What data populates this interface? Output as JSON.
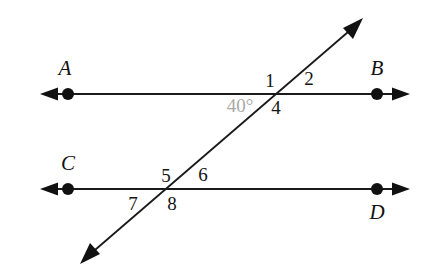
{
  "figure": {
    "kind": "geometry-diagram",
    "width": 433,
    "height": 279,
    "background_color": "#ffffff",
    "stroke_color": "#1a1a1a",
    "measure_color": "#a9a9a9"
  },
  "lines": [
    {
      "id": "line-ab",
      "name": "AB",
      "orientation": "horizontal",
      "y": 94,
      "x_start": 40,
      "x_end": 410,
      "arrow_start": true,
      "arrow_end": true,
      "endpoint_dots": [
        68,
        377
      ]
    },
    {
      "id": "line-cd",
      "name": "CD",
      "orientation": "horizontal",
      "y": 189,
      "x_start": 40,
      "x_end": 410,
      "arrow_start": true,
      "arrow_end": true,
      "endpoint_dots": [
        68,
        377
      ]
    },
    {
      "id": "line-transversal",
      "name": "transversal",
      "orientation": "diagonal",
      "x_start": 80,
      "y_start": 264,
      "x_end": 363,
      "y_end": 18,
      "arrow_start": true,
      "arrow_end": true,
      "endpoint_dots": []
    }
  ],
  "intersections": [
    {
      "id": "upper",
      "x": 278,
      "y": 94,
      "on_line": "AB"
    },
    {
      "id": "lower",
      "x": 169,
      "y": 189,
      "on_line": "CD"
    }
  ],
  "point_labels": [
    {
      "id": "label-a",
      "text": "A",
      "x": 65,
      "y": 68
    },
    {
      "id": "label-b",
      "text": "B",
      "x": 377,
      "y": 68
    },
    {
      "id": "label-c",
      "text": "C",
      "x": 68,
      "y": 163
    },
    {
      "id": "label-d",
      "text": "D",
      "x": 377,
      "y": 212
    }
  ],
  "angle_labels": [
    {
      "id": "angle-1",
      "text": "1",
      "x": 270,
      "y": 80,
      "position": "upper-left-of-upper-intersection"
    },
    {
      "id": "angle-2",
      "text": "2",
      "x": 309,
      "y": 78,
      "position": "upper-right-of-upper-intersection"
    },
    {
      "id": "angle-4",
      "text": "4",
      "x": 276,
      "y": 107,
      "position": "lower-right-of-upper-intersection"
    },
    {
      "id": "angle-5",
      "text": "5",
      "x": 166,
      "y": 175,
      "position": "upper-left-of-lower-intersection"
    },
    {
      "id": "angle-6",
      "text": "6",
      "x": 203,
      "y": 174,
      "position": "upper-right-of-lower-intersection"
    },
    {
      "id": "angle-7",
      "text": "7",
      "x": 133,
      "y": 203,
      "position": "lower-left-of-lower-intersection"
    },
    {
      "id": "angle-8",
      "text": "8",
      "x": 172,
      "y": 203,
      "position": "lower-right-of-lower-intersection"
    }
  ],
  "measures": [
    {
      "id": "measure-40",
      "text": "40°",
      "value": 40,
      "unit": "degrees",
      "x": 240,
      "y": 105,
      "color": "#a9a9a9",
      "describes": "angle-3"
    }
  ]
}
